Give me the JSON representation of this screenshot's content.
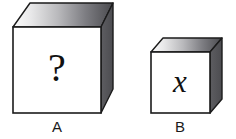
{
  "figure": {
    "background_color": "#ffffff",
    "width": 236,
    "height": 139
  },
  "palette": {
    "front_face": "#ffffff",
    "right_face": "#555559",
    "top_face_light": "#f2f2f2",
    "top_face_dark": "#4d4d51",
    "outline": "#1b1b1b",
    "text": "#111111"
  },
  "cubes": [
    {
      "id": "cube-a",
      "label": "A",
      "front_text": "?",
      "front_text_style": "serif-upright",
      "size": "large",
      "geometry": {
        "front": {
          "x": 13,
          "y": 27,
          "w": 88,
          "h": 86
        },
        "top_back_left_x": 30,
        "top_back_right_x": 113,
        "top_back_y": 3,
        "right_back_bottom_y": 89
      }
    },
    {
      "id": "cube-b",
      "label": "B",
      "front_text": "x",
      "front_text_style": "serif-italic",
      "size": "small",
      "geometry": {
        "front": {
          "x": 151,
          "y": 52,
          "w": 59,
          "h": 61
        },
        "top_back_left_x": 163,
        "top_back_right_x": 222,
        "top_back_y": 38,
        "right_back_bottom_y": 99
      }
    }
  ]
}
